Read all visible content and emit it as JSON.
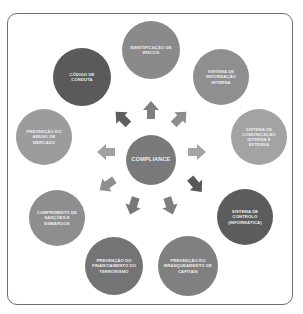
{
  "diagram": {
    "center": {
      "label": "COMPLIANCE",
      "color": "#7a7a7a"
    },
    "nodes": [
      {
        "id": "identificacao-riscos",
        "label": "IDENTIFICAÇÃO DE RISCOS",
        "color": "#8a8a8a"
      },
      {
        "id": "sistema-informacao-interna",
        "label": "SISTEMA DE INFORMAÇÃO INTERNA",
        "color": "#8f8f8f"
      },
      {
        "id": "sistema-comunicacao",
        "label": "SISTEMA DE COMUNICAÇÃO INTERNA E EXTERNA",
        "color": "#a3a3a3"
      },
      {
        "id": "sistema-controlo",
        "label": "SISTEMA DE CONTROLO (INFORMÁTICA)",
        "color": "#5c5c5c"
      },
      {
        "id": "prevencao-branqueamento",
        "label": "PREVENÇÃO DO BRANQUEAMENTO DE CAPITAIS",
        "color": "#808080"
      },
      {
        "id": "prevencao-terrorismo",
        "label": "PREVENÇÃO DO FINANCIAMENTO DO TERRORISMO",
        "color": "#747474"
      },
      {
        "id": "cumprimento-sancoes",
        "label": "CUMPRIMENTO DE SANÇÕES E EMBARGOS",
        "color": "#8e8e8e"
      },
      {
        "id": "prevencao-abuso-mercado",
        "label": "PREVENÇÃO DO ABUSO DE MERCADO",
        "color": "#9c9c9c"
      },
      {
        "id": "codigo-conduta",
        "label": "CÓDIGO DE CONDUTA",
        "color": "#5a5a5a"
      }
    ],
    "arrow_colors": {
      "n": "#7f7f7f",
      "ne": "#8c8c8c",
      "e": "#a5a5a5",
      "se": "#595959",
      "s_right": "#7e7e7e",
      "s_left": "#777777",
      "sw": "#8e8e8e",
      "w": "#a2a2a2",
      "nw": "#5d5d5d"
    },
    "frame_color": "#6e6e6e"
  }
}
